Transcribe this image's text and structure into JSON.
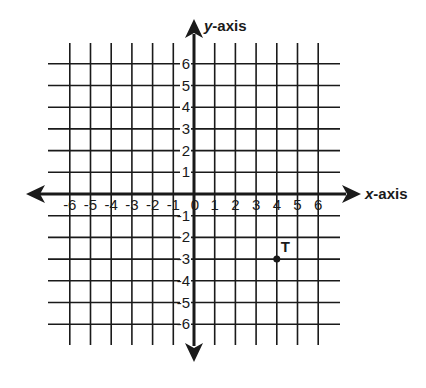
{
  "chart_data": {
    "type": "scatter",
    "title": "",
    "xlabel": "x-axis",
    "ylabel": "y-axis",
    "xlabel_italic_part": "x",
    "xlabel_rest": "-axis",
    "ylabel_italic_part": "y",
    "ylabel_rest": "-axis",
    "xlim": [
      -6,
      6
    ],
    "ylim": [
      -6,
      6
    ],
    "grid": true,
    "x_ticks": [
      -6,
      -5,
      -4,
      -3,
      -2,
      -1,
      0,
      1,
      2,
      3,
      4,
      5,
      6
    ],
    "y_ticks": [
      -6,
      -5,
      -4,
      -3,
      -2,
      -1,
      1,
      2,
      3,
      4,
      5,
      6
    ],
    "points": [
      {
        "label": "T",
        "x": 4,
        "y": -3
      }
    ]
  },
  "colors": {
    "line": "#1a1a1a",
    "background": "#ffffff"
  },
  "icons": {
    "x_arrow": "double-headed-arrow-horizontal",
    "y_arrow": "double-headed-arrow-vertical",
    "point_marker": "filled-dot"
  }
}
